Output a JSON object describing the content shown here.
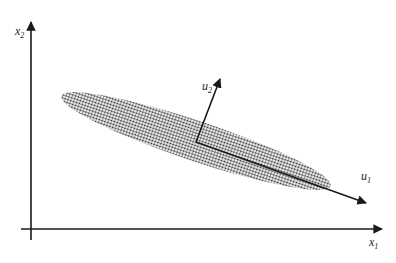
{
  "diagram": {
    "title": "",
    "axes": {
      "x_label": "x",
      "x_sub": "1",
      "y_label": "x",
      "y_sub": "2"
    },
    "vectors": [
      {
        "name": "u",
        "sub": "2",
        "description": "second principal direction (short)"
      },
      {
        "name": "u",
        "sub": "1",
        "description": "first principal direction (long)"
      }
    ],
    "ellipse": {
      "description": "dotted elongated point cloud oriented downward-right"
    },
    "colors": {
      "ink": "#1a1a1a",
      "dots": "#333333",
      "background": "#ffffff"
    }
  }
}
